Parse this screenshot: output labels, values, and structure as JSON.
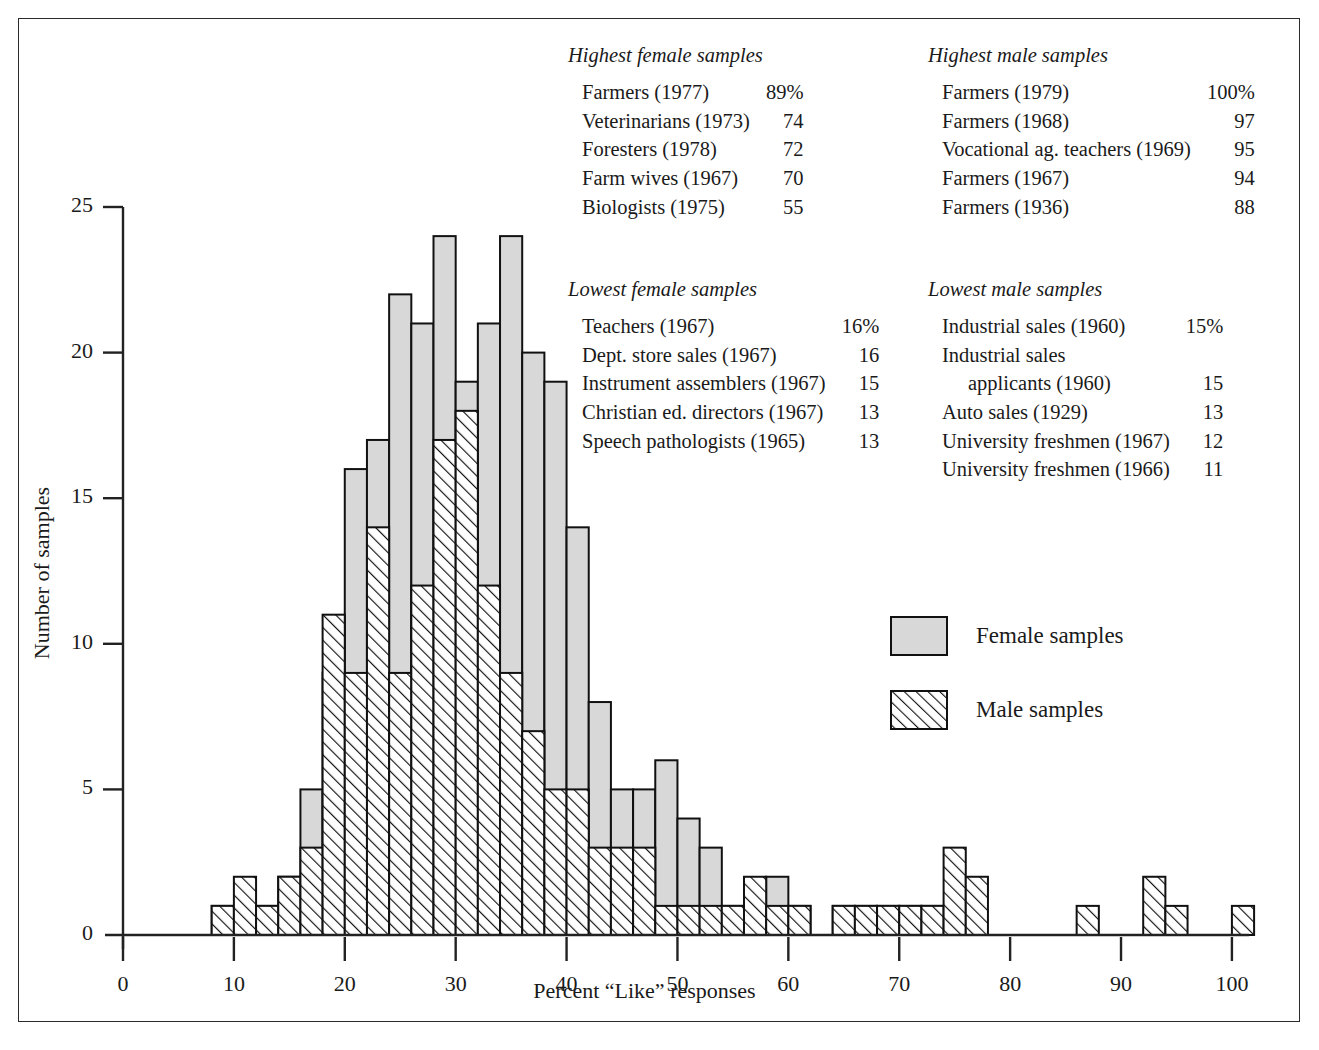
{
  "figure": {
    "xlabel": "Percent “Like” responses",
    "ylabel": "Number of samples"
  },
  "legend": {
    "female_label": "Female samples",
    "male_label": "Male samples",
    "female_swatch": "female-swatch",
    "male_swatch": "male-swatch"
  },
  "notes": {
    "highest_female": {
      "title": "Highest female samples",
      "rows": [
        {
          "label": "Farmers (1977)",
          "value": "89%"
        },
        {
          "label": "Veterinarians (1973)",
          "value": "74"
        },
        {
          "label": "Foresters (1978)",
          "value": "72"
        },
        {
          "label": "Farm wives (1967)",
          "value": "70"
        },
        {
          "label": "Biologists (1975)",
          "value": "55"
        }
      ]
    },
    "highest_male": {
      "title": "Highest male samples",
      "rows": [
        {
          "label": "Farmers (1979)",
          "value": "100%"
        },
        {
          "label": "Farmers (1968)",
          "value": "97"
        },
        {
          "label": "Vocational ag. teachers (1969)",
          "value": "95"
        },
        {
          "label": "Farmers (1967)",
          "value": "94"
        },
        {
          "label": "Farmers (1936)",
          "value": "88"
        }
      ]
    },
    "lowest_female": {
      "title": "Lowest female samples",
      "rows": [
        {
          "label": "Teachers (1967)",
          "value": "16%"
        },
        {
          "label": "Dept. store sales (1967)",
          "value": "16"
        },
        {
          "label": "Instrument assemblers (1967)",
          "value": "15"
        },
        {
          "label": "Christian ed. directors (1967)",
          "value": "13"
        },
        {
          "label": "Speech pathologists (1965)",
          "value": "13"
        }
      ]
    },
    "lowest_male": {
      "title": "Lowest male samples",
      "rows": [
        {
          "label": "Industrial sales (1960)",
          "value": "15%"
        },
        {
          "label": "Industrial sales",
          "value": ""
        },
        {
          "label": "applicants (1960)",
          "value": "15",
          "indent": true
        },
        {
          "label": "Auto sales (1929)",
          "value": "13"
        },
        {
          "label": "University freshmen (1967)",
          "value": "12"
        },
        {
          "label": "University freshmen (1966)",
          "value": "11"
        }
      ]
    }
  },
  "chart_data": {
    "type": "bar",
    "subtype": "overlaid-histogram",
    "title": "",
    "xlabel": "Percent “Like” responses",
    "ylabel": "Number of samples",
    "xlim": [
      0,
      101
    ],
    "ylim": [
      0,
      25
    ],
    "xticks": [
      0,
      10,
      20,
      30,
      40,
      50,
      60,
      70,
      80,
      90,
      100
    ],
    "yticks": [
      0,
      5,
      10,
      15,
      20,
      25
    ],
    "grid": false,
    "legend_position": "inside-right",
    "bin_width": 2,
    "bin_starts": [
      8,
      10,
      12,
      14,
      16,
      18,
      20,
      22,
      24,
      26,
      28,
      30,
      32,
      34,
      36,
      38,
      40,
      42,
      44,
      46,
      48,
      50,
      52,
      54,
      56,
      58,
      60,
      62,
      64,
      66,
      68,
      70,
      72,
      74,
      76,
      78,
      80,
      82,
      84,
      86,
      88,
      90,
      92,
      94,
      96,
      98,
      100
    ],
    "series": [
      {
        "name": "Female samples",
        "style": "solid-gray",
        "color": "#d8d8d8",
        "values": [
          1,
          1,
          1,
          2,
          5,
          9,
          16,
          17,
          22,
          21,
          24,
          19,
          21,
          24,
          20,
          19,
          14,
          8,
          5,
          5,
          6,
          4,
          3,
          1,
          1,
          2,
          1,
          0,
          1,
          1,
          1,
          1,
          1,
          1,
          0,
          0,
          0,
          0,
          0,
          0,
          0,
          0,
          0,
          0,
          0,
          0,
          0
        ]
      },
      {
        "name": "Male samples",
        "style": "diagonal-hatch",
        "color": "#ffffff",
        "values": [
          1,
          2,
          1,
          2,
          3,
          11,
          9,
          14,
          9,
          12,
          17,
          18,
          12,
          9,
          7,
          5,
          5,
          3,
          3,
          3,
          1,
          1,
          1,
          1,
          2,
          1,
          1,
          0,
          1,
          1,
          1,
          1,
          1,
          3,
          2,
          0,
          0,
          0,
          0,
          1,
          0,
          0,
          2,
          1,
          0,
          0,
          1
        ]
      }
    ],
    "note": "Female (solid gray) values are the full bar heights; male (hatched) values are drawn overlapping in front within the same bin."
  }
}
